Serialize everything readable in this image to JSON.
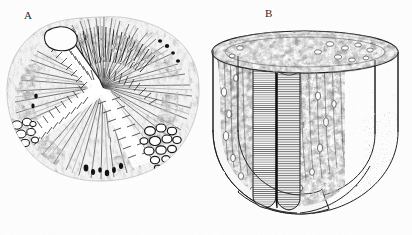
{
  "figure": {
    "background_color": "#fefefe",
    "ink_color": "#1d1d1d",
    "panels": [
      {
        "id": "A",
        "label": "A",
        "name": "transverse-section-panel",
        "view": "transverse cross-section",
        "lumen_shape": "triradiate",
        "features": [
          "triradiate lumen",
          "villous epithelial lining",
          "radiating fibromuscular stroma",
          "glandular acinar cluster left",
          "glandular acinar cluster right",
          "outlined duct top-left"
        ]
      },
      {
        "id": "B",
        "label": "B",
        "name": "three-dimensional-cutaway-panel",
        "view": "three-dimensional cylindrical cutaway",
        "features": [
          "elliptical top rim",
          "central cleft with hatched cut faces",
          "mottled inner wall",
          "stippled outer surface",
          "quarter segment removed"
        ]
      }
    ]
  }
}
